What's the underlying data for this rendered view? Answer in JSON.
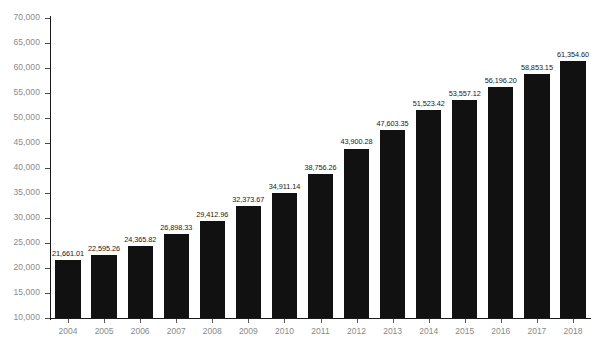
{
  "chart_data": {
    "type": "bar",
    "title": "",
    "subtitle": "",
    "xlabel": "",
    "ylabel": "",
    "categories": [
      "2004",
      "2005",
      "2006",
      "2007",
      "2008",
      "2009",
      "2010",
      "2011",
      "2012",
      "2013",
      "2014",
      "2015",
      "2016",
      "2017",
      "2018"
    ],
    "values": [
      21661.01,
      22595.26,
      24365.82,
      26898.33,
      29412.96,
      32373.67,
      34911.14,
      38756.26,
      43900.28,
      47603.35,
      51523.42,
      53557.12,
      56196.2,
      58853.15,
      61354.6
    ],
    "value_labels": [
      "21,661.01",
      "22,595.26",
      "24,365.82",
      "26,898.33",
      "29,412.96",
      "32,373.67",
      "34,911.14",
      "38,756.26",
      "43,900.28",
      "47,603.35",
      "51,523.42",
      "53,557.12",
      "56,196.20",
      "58,853.15",
      "61,354.60"
    ],
    "ylim": [
      10000,
      70000
    ],
    "ytick_values": [
      70000,
      65000,
      60000,
      55000,
      50000,
      45000,
      40000,
      35000,
      30000,
      25000,
      20000,
      15000,
      10000
    ],
    "ytick_labels": [
      "70,000",
      "65,000",
      "60,000",
      "55,000",
      "50,000",
      "45,000",
      "40,000",
      "35,000",
      "30,000",
      "25,000",
      "20,000",
      "15,000",
      "10,000"
    ],
    "grid": false,
    "legend": null,
    "legend_position": "none",
    "bar_color": "#111111",
    "axis_color": "#1a1a1a",
    "tick_label_color": "#8a8a8a",
    "value_label_color": "#1a1a1a",
    "background_color": "#ffffff"
  }
}
